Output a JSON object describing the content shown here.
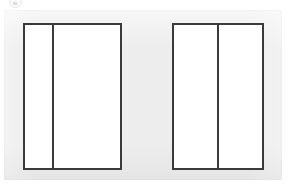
{
  "canvas": {
    "width": 289,
    "height": 191,
    "background_color": "#ffffff"
  },
  "backdrop": {
    "label": "backdrop panel",
    "fill_color": "#ededed",
    "x": 4,
    "y": 10,
    "width": 278,
    "height": 170
  },
  "top_badge": {
    "icon": "circle-badge-icon",
    "visible_fragment": true
  },
  "frames": [
    {
      "name": "left-frame",
      "x": 23,
      "y": 23,
      "width": 99,
      "height": 147,
      "border_color": "#3a3a3c",
      "border_width": 2,
      "fill_color": "#ffffff",
      "divider_offset": 29,
      "panes": [
        {
          "name": "left-frame-pane-1",
          "width": 29
        },
        {
          "name": "left-frame-pane-2",
          "width": 68
        }
      ]
    },
    {
      "name": "right-frame",
      "x": 172,
      "y": 23,
      "width": 92,
      "height": 147,
      "border_color": "#3a3a3c",
      "border_width": 2,
      "fill_color": "#ffffff",
      "divider_offset": 45,
      "panes": [
        {
          "name": "right-frame-pane-1",
          "width": 45
        },
        {
          "name": "right-frame-pane-2",
          "width": 45
        }
      ]
    }
  ]
}
